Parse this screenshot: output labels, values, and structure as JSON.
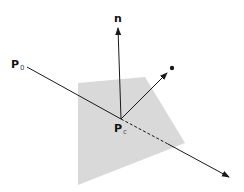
{
  "diagram": {
    "title": "",
    "labels": {
      "normal": "n",
      "origin_point": "P",
      "origin_subscript": "0",
      "intersection_point": "P",
      "intersection_subscript": "c"
    },
    "colors": {
      "plane_fill": "#d9d9d9",
      "line": "#1a1a1a",
      "background": "#ffffff"
    },
    "geometry": {
      "plane_polygon": [
        [
          78,
          83
        ],
        [
          145,
          77
        ],
        [
          185,
          143
        ],
        [
          78,
          185
        ]
      ],
      "ray_start": [
        27,
        67
      ],
      "intersection": [
        121,
        119
      ],
      "dashed_end": [
        168,
        144
      ],
      "ray_end": [
        230,
        178
      ],
      "normal_end": [
        118,
        27
      ],
      "reflect_end": [
        167,
        73
      ],
      "reflect_dot": [
        172,
        68
      ]
    }
  }
}
